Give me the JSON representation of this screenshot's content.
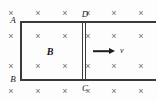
{
  "figure": {
    "background_color": "#fdfdfd",
    "width": 158,
    "height": 102
  },
  "field": {
    "symbol": "×",
    "meaning": "magnetic field directed into the page",
    "color": "#6f6f70",
    "label": "B",
    "label_style": "bold-italic",
    "label_color": "#121214",
    "label_position": {
      "x": 50,
      "y": 52
    },
    "rows": 4,
    "columns": 6,
    "marks": [
      {
        "x": 11,
        "y": 13
      },
      {
        "x": 38,
        "y": 13
      },
      {
        "x": 65,
        "y": 13
      },
      {
        "x": 88,
        "y": 13
      },
      {
        "x": 114,
        "y": 13
      },
      {
        "x": 141,
        "y": 13
      },
      {
        "x": 11,
        "y": 36
      },
      {
        "x": 38,
        "y": 36
      },
      {
        "x": 65,
        "y": 36
      },
      {
        "x": 88,
        "y": 36
      },
      {
        "x": 114,
        "y": 36
      },
      {
        "x": 141,
        "y": 36
      },
      {
        "x": 11,
        "y": 66
      },
      {
        "x": 38,
        "y": 66
      },
      {
        "x": 65,
        "y": 66
      },
      {
        "x": 88,
        "y": 66
      },
      {
        "x": 114,
        "y": 66
      },
      {
        "x": 141,
        "y": 66
      },
      {
        "x": 11,
        "y": 91
      },
      {
        "x": 38,
        "y": 91
      },
      {
        "x": 65,
        "y": 91
      },
      {
        "x": 88,
        "y": 91
      },
      {
        "x": 114,
        "y": 91
      },
      {
        "x": 141,
        "y": 91
      }
    ]
  },
  "circuit": {
    "conductor_color": "#3a3a3c",
    "rails": [
      {
        "name": "top-rail",
        "x": 20,
        "y": 21,
        "length": 136,
        "orientation": "horizontal"
      },
      {
        "name": "bottom-rail",
        "x": 20,
        "y": 79,
        "length": 136,
        "orientation": "horizontal"
      },
      {
        "name": "left-conductor-AB",
        "x": 20,
        "y": 21,
        "length": 60,
        "orientation": "vertical"
      }
    ],
    "sliding_bar": {
      "name": "CD",
      "x": 82,
      "y": 21,
      "height": 60,
      "orientation": "vertical",
      "style": "double-line"
    }
  },
  "labels": {
    "points": [
      {
        "id": "A",
        "text": "A",
        "x": 13,
        "y": 20
      },
      {
        "id": "B",
        "text": "B",
        "x": 13,
        "y": 79
      },
      {
        "id": "C",
        "text": "C",
        "x": 85,
        "y": 88
      },
      {
        "id": "D",
        "text": "D",
        "x": 85,
        "y": 14
      }
    ]
  },
  "velocity": {
    "label": "v",
    "label_style": "italic",
    "direction": "right",
    "arrow": {
      "x": 93,
      "y": 51,
      "length": 22
    },
    "label_position": {
      "x": 120,
      "y": 51
    },
    "color": "#1d1d1f"
  }
}
